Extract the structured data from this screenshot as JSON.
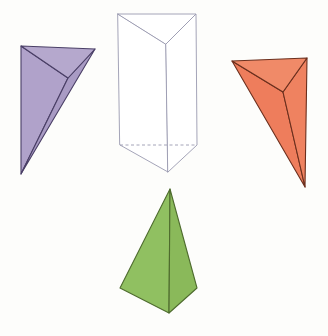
{
  "figure": {
    "background_color": "#fdfdfb",
    "width": 328,
    "height": 336,
    "shape_count": 4
  },
  "chart_data": {
    "type": "diagram",
    "shapes": [
      {
        "name": "purple-tetrahedron",
        "label": "Tetrahedron",
        "fill": "#b3a6cc",
        "stroke": "#4a3f66",
        "stroke_width": 1.1,
        "position": "top-left",
        "vertices": {
          "top_left": [
            21,
            46
          ],
          "top_right": [
            95,
            49
          ],
          "bottom": [
            21,
            174
          ],
          "interior": [
            68,
            78
          ]
        },
        "faces": [
          {
            "id": "purple-face-top",
            "fill": "#b5a8cd",
            "points": "21,46 95,49 68,78"
          },
          {
            "id": "purple-face-left",
            "fill": "#b0a2ca",
            "points": "21,46 68,78 21,174"
          },
          {
            "id": "purple-face-right",
            "fill": "#a99bc4",
            "points": "68,78 95,49 21,174"
          }
        ]
      },
      {
        "name": "white-triangular-prism",
        "label": "Triangular prism",
        "fill": "#ffffff",
        "stroke": "#9a9ab0",
        "stroke_width": 0.9,
        "position": "top-center",
        "vertices": {
          "top_back_left": [
            118,
            14
          ],
          "top_back_right": [
            196,
            14
          ],
          "top_front": [
            166,
            44
          ],
          "bottom_back_left": [
            120,
            145
          ],
          "bottom_back_right": [
            197,
            145
          ],
          "bottom_front": [
            168,
            172
          ]
        },
        "faces": [
          {
            "id": "prism-face-top",
            "fill": "#ffffff",
            "points": "118,14 196,14 166,44"
          },
          {
            "id": "prism-face-left",
            "fill": "#ffffff",
            "points": "118,14 166,44 168,172 120,145"
          },
          {
            "id": "prism-face-right",
            "fill": "#ffffff",
            "points": "166,44 196,14 197,145 168,172"
          }
        ],
        "hidden_edges": [
          {
            "id": "prism-hidden-bottom",
            "points": "120,145 197,145",
            "dash": "3,2.5"
          }
        ]
      },
      {
        "name": "orange-tetrahedron",
        "label": "Tetrahedron",
        "fill": "#ef7e5e",
        "stroke": "#6b2f1d",
        "stroke_width": 1.1,
        "position": "top-right",
        "vertices": {
          "top_left": [
            232,
            61
          ],
          "top_right": [
            307,
            58
          ],
          "bottom": [
            305,
            187
          ],
          "interior": [
            283,
            92
          ]
        },
        "faces": [
          {
            "id": "orange-face-top",
            "fill": "#f08a68",
            "points": "232,61 307,58 283,92"
          },
          {
            "id": "orange-face-left",
            "fill": "#ee7d5c",
            "points": "232,61 283,92 305,187"
          },
          {
            "id": "orange-face-right",
            "fill": "#ef8260",
            "points": "283,92 307,58 305,187"
          }
        ]
      },
      {
        "name": "green-pyramid",
        "label": "Triangular pyramid",
        "fill": "#8fbf5f",
        "stroke": "#4e6b2e",
        "stroke_width": 1.1,
        "position": "bottom-center",
        "vertices": {
          "apex": [
            170,
            189
          ],
          "base_back_left": [
            120,
            288
          ],
          "base_back_right": [
            197,
            288
          ],
          "base_front": [
            169,
            313
          ]
        },
        "faces": [
          {
            "id": "green-face-left",
            "fill": "#90c061",
            "points": "170,189 120,288 169,313"
          },
          {
            "id": "green-face-right",
            "fill": "#8ab95a",
            "points": "170,189 169,313 197,288"
          }
        ]
      }
    ]
  }
}
